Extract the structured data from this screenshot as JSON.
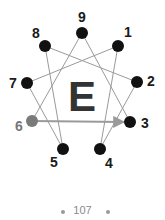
{
  "diagram": {
    "center_letter": "E",
    "colors": {
      "node": "#111111",
      "highlight_node": "#7a7a7a",
      "line": "#9a9a9a",
      "arrow": "#9a9a9a",
      "label": "#1a1a1a",
      "highlight_label": "#777777",
      "letter": "#333333"
    },
    "nodes": [
      {
        "id": "9",
        "label": "9",
        "x": 82,
        "y": 33,
        "lx": 82,
        "ly": 22,
        "highlight": false
      },
      {
        "id": "1",
        "label": "1",
        "x": 118,
        "y": 46,
        "lx": 128,
        "ly": 37,
        "highlight": false
      },
      {
        "id": "2",
        "label": "2",
        "x": 137,
        "y": 82,
        "lx": 151,
        "ly": 86,
        "highlight": false
      },
      {
        "id": "3",
        "label": "3",
        "x": 130,
        "y": 122,
        "lx": 145,
        "ly": 128,
        "highlight": false
      },
      {
        "id": "4",
        "label": "4",
        "x": 100,
        "y": 149,
        "lx": 109,
        "ly": 168,
        "highlight": false
      },
      {
        "id": "5",
        "label": "5",
        "x": 63,
        "y": 149,
        "lx": 54,
        "ly": 167,
        "highlight": false
      },
      {
        "id": "6",
        "label": "6",
        "x": 32,
        "y": 121,
        "lx": 19,
        "ly": 131,
        "highlight": true
      },
      {
        "id": "7",
        "label": "7",
        "x": 27,
        "y": 83,
        "lx": 13,
        "ly": 88,
        "highlight": false
      },
      {
        "id": "8",
        "label": "8",
        "x": 45,
        "y": 46,
        "lx": 36,
        "ly": 38,
        "highlight": false
      }
    ],
    "lines": [
      [
        "9",
        "6"
      ],
      [
        "9",
        "3"
      ],
      [
        "1",
        "4"
      ],
      [
        "4",
        "2"
      ],
      [
        "2",
        "8"
      ],
      [
        "8",
        "5"
      ],
      [
        "5",
        "7"
      ],
      [
        "7",
        "1"
      ]
    ],
    "arrow": {
      "from": "6",
      "to": "3"
    }
  },
  "footer": {
    "page_number": "107"
  }
}
